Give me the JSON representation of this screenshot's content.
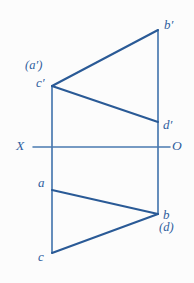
{
  "figure": {
    "kind": "orthographic-projection-diagram",
    "width": 194,
    "height": 283,
    "background_color": "#fcfcfc",
    "colors": {
      "diagonal_stroke": "#2a5a96",
      "vertical_stroke": "#4a7ab0",
      "axis_stroke": "#4a7ab0",
      "label_text": "#2f5e9e"
    },
    "axis": {
      "left_label": "X",
      "right_label": "O",
      "y": 147,
      "x_start": 33,
      "x_end": 170
    },
    "labels": {
      "b_prime": "b′",
      "a_prime_paren": "(a′)",
      "c_prime": "c′",
      "d_prime": "d′",
      "a": "a",
      "b": "b",
      "d_paren": "(d)",
      "c": "c"
    },
    "points": {
      "b_prime": {
        "x": 158,
        "y": 30
      },
      "c_prime": {
        "x": 52,
        "y": 86
      },
      "d_prime": {
        "x": 158,
        "y": 122
      },
      "a": {
        "x": 52,
        "y": 190
      },
      "b": {
        "x": 158,
        "y": 214
      },
      "c": {
        "x": 52,
        "y": 253
      }
    },
    "edges": [
      {
        "name": "left-vertical-c-prime-to-c",
        "x1": 52,
        "y1": 86,
        "x2": 52,
        "y2": 253,
        "style": "vertical"
      },
      {
        "name": "right-vertical-b-prime-to-b",
        "x1": 158,
        "y1": 30,
        "x2": 158,
        "y2": 214,
        "style": "vertical"
      },
      {
        "name": "diagonal-c-prime-to-b-prime",
        "x1": 52,
        "y1": 86,
        "x2": 158,
        "y2": 30,
        "style": "diagonal"
      },
      {
        "name": "diagonal-c-prime-to-d-prime",
        "x1": 52,
        "y1": 86,
        "x2": 158,
        "y2": 122,
        "style": "diagonal"
      },
      {
        "name": "diagonal-a-to-b",
        "x1": 52,
        "y1": 190,
        "x2": 158,
        "y2": 214,
        "style": "diagonal"
      },
      {
        "name": "diagonal-c-to-b",
        "x1": 52,
        "y1": 253,
        "x2": 158,
        "y2": 214,
        "style": "diagonal"
      }
    ],
    "label_positions": {
      "b_prime": {
        "left": 164,
        "top": 18
      },
      "a_prime_paren": {
        "left": 25,
        "top": 59
      },
      "c_prime": {
        "left": 36,
        "top": 76
      },
      "d_prime": {
        "left": 163,
        "top": 118
      },
      "x": {
        "left": 16,
        "top": 139
      },
      "o": {
        "left": 172,
        "top": 139
      },
      "a": {
        "left": 38,
        "top": 176
      },
      "b": {
        "left": 163,
        "top": 208
      },
      "d_paren": {
        "left": 159,
        "top": 221
      },
      "c": {
        "left": 38,
        "top": 250
      }
    }
  }
}
